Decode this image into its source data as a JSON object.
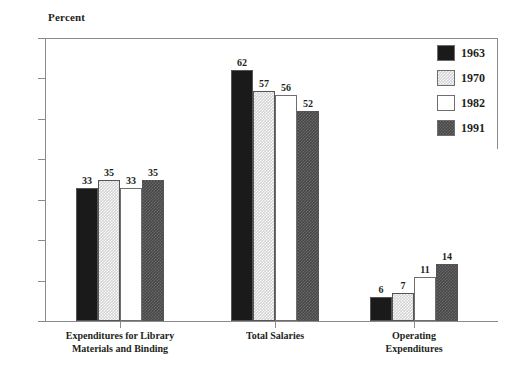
{
  "chart_data": {
    "type": "bar",
    "title": "",
    "ylabel": "Percent",
    "xlabel": "",
    "ylim": [
      0,
      70
    ],
    "yticks": [
      0,
      10,
      20,
      30,
      40,
      50,
      60,
      70
    ],
    "grid": false,
    "legend_position": "top-right",
    "categories": [
      "Expenditures for Library\nMaterials and Binding",
      "Total Salaries",
      "Operating\nExpenditures"
    ],
    "category_lines": [
      [
        "Expenditures for Library",
        "Materials and Binding"
      ],
      [
        "Total Salaries"
      ],
      [
        "Operating",
        "Expenditures"
      ]
    ],
    "series": [
      {
        "name": "1963",
        "values": [
          33,
          62,
          6
        ],
        "color": "#1a1a1a",
        "fill": "solid-black"
      },
      {
        "name": "1970",
        "values": [
          35,
          57,
          7
        ],
        "color": "#d2d2d2",
        "fill": "light-checker"
      },
      {
        "name": "1982",
        "values": [
          33,
          56,
          11
        ],
        "color": "#ffffff",
        "fill": "white"
      },
      {
        "name": "1991",
        "values": [
          35,
          52,
          14
        ],
        "color": "#474747",
        "fill": "dark-checker"
      }
    ]
  },
  "legend": {
    "items": [
      {
        "label": "1963",
        "swatch": "fill-1963"
      },
      {
        "label": "1970",
        "swatch": "fill-1970"
      },
      {
        "label": "1982",
        "swatch": "fill-1982"
      },
      {
        "label": "1991",
        "swatch": "fill-1991"
      }
    ]
  },
  "axis": {
    "y_title": "Percent",
    "y_tick_labels": [
      "70",
      "60",
      "50",
      "40",
      "30",
      "20",
      "10",
      "0"
    ]
  }
}
